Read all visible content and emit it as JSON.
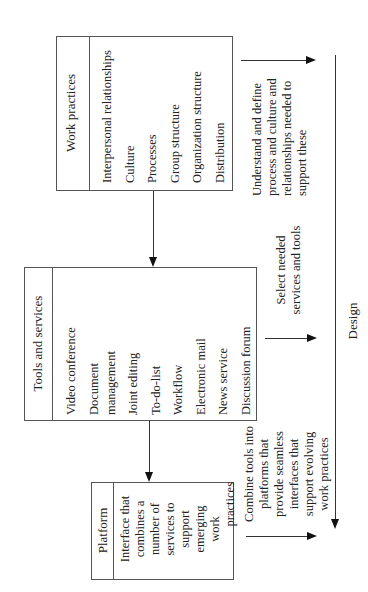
{
  "diagram": {
    "orientation": "rotated-90-ccw",
    "work_practices": {
      "title": "Work practices",
      "items": [
        "Interpersonal relationships",
        "Culture",
        "Processes",
        "Group structure",
        "Organization structure",
        "Distribution"
      ]
    },
    "tools_and_services": {
      "title": "Tools and services",
      "items": [
        "Video conference",
        "Document",
        "management",
        "Joint editing",
        "To-do-list",
        "Workflow",
        "Electronic mail",
        "News service",
        "Discussion forum"
      ]
    },
    "platform": {
      "title": "Platform",
      "description_lines": [
        "Interface that",
        "combines a",
        "number of",
        "services to",
        "support",
        "emerging",
        "work",
        "practices"
      ]
    },
    "annotations": {
      "understand": [
        "Understand and define",
        "process and culture and",
        "relationships needed to",
        "support these"
      ],
      "select": [
        "Select needed",
        "services and tools"
      ],
      "combine": [
        "Combine tools into",
        "platforms that",
        "provide seamless",
        "interfaces that",
        "support evolving",
        "work practices"
      ]
    },
    "design_label": "Design"
  }
}
